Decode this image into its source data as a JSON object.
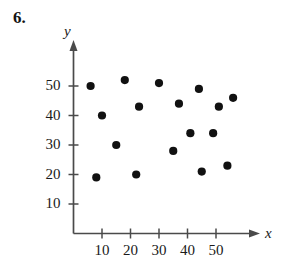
{
  "exercise": {
    "number": "6."
  },
  "chart_data": {
    "type": "scatter",
    "title": "",
    "xlabel": "x",
    "ylabel": "y",
    "xlim": [
      0,
      62
    ],
    "ylim": [
      0,
      58
    ],
    "x_ticks": [
      10,
      20,
      30,
      40,
      50
    ],
    "y_ticks": [
      10,
      20,
      30,
      40,
      50
    ],
    "x_tick_labels": [
      "10",
      "20",
      "30",
      "40",
      "50"
    ],
    "y_tick_labels": [
      "10",
      "20",
      "30",
      "40",
      "50"
    ],
    "grid": false,
    "legend": null,
    "marker": "filled-circle",
    "marker_color": "#111111",
    "axis_color": "#4a4a4a",
    "points": [
      {
        "x": 6,
        "y": 50
      },
      {
        "x": 10,
        "y": 40
      },
      {
        "x": 15,
        "y": 30
      },
      {
        "x": 8,
        "y": 19
      },
      {
        "x": 18,
        "y": 52
      },
      {
        "x": 23,
        "y": 43
      },
      {
        "x": 22,
        "y": 20
      },
      {
        "x": 30,
        "y": 51
      },
      {
        "x": 37,
        "y": 44
      },
      {
        "x": 35,
        "y": 28
      },
      {
        "x": 41,
        "y": 34
      },
      {
        "x": 44,
        "y": 49
      },
      {
        "x": 45,
        "y": 21
      },
      {
        "x": 49,
        "y": 34
      },
      {
        "x": 51,
        "y": 43
      },
      {
        "x": 54,
        "y": 23
      },
      {
        "x": 56,
        "y": 46
      }
    ]
  }
}
